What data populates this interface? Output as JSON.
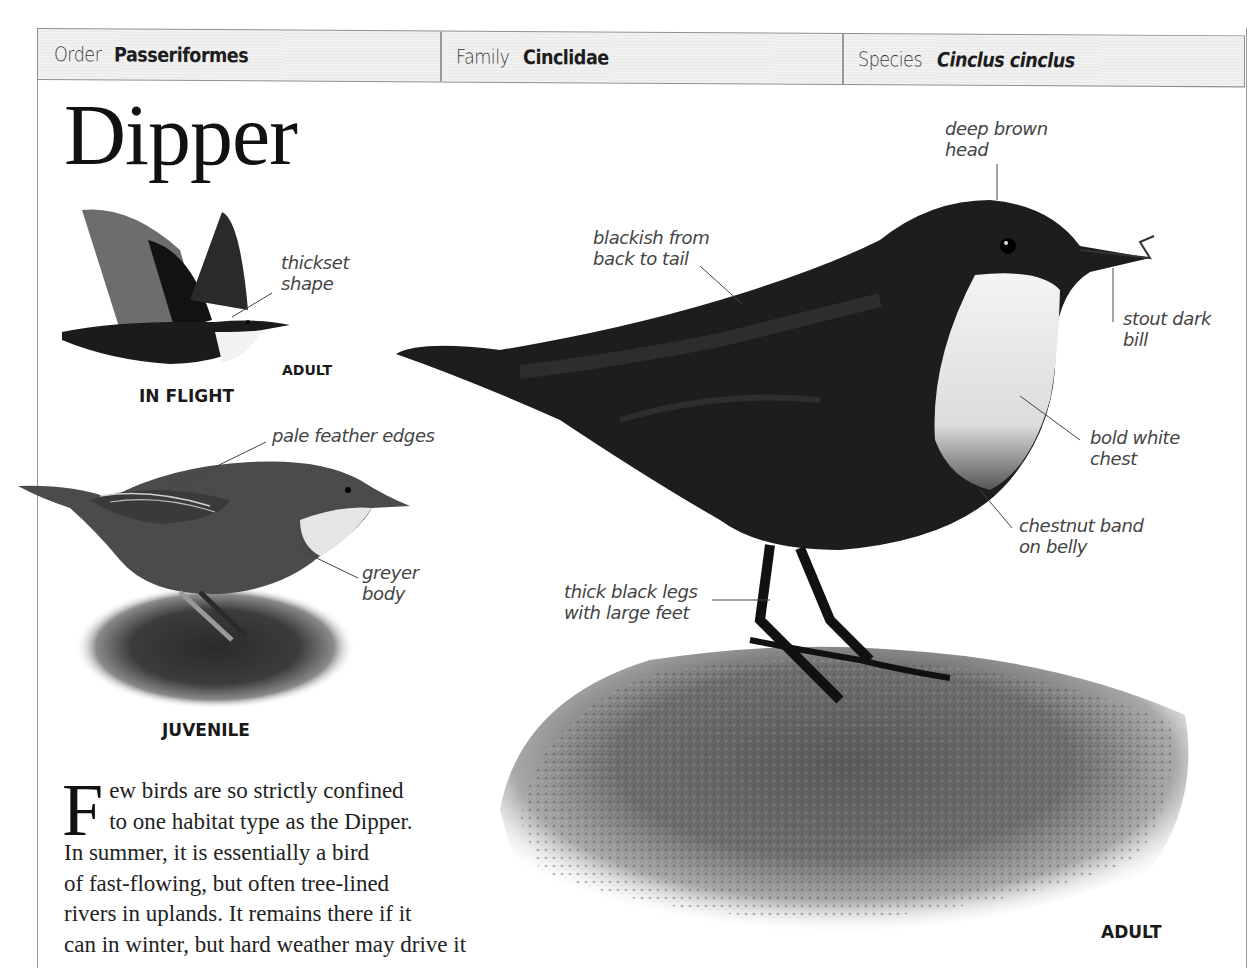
{
  "header": {
    "order": {
      "label": "Order",
      "value": "Passeriformes"
    },
    "family": {
      "label": "Family",
      "value": "Cinclidae"
    },
    "species": {
      "label": "Species",
      "value": "Cinclus cinclus"
    }
  },
  "title": "Dipper",
  "figures": {
    "in_flight": {
      "caption": "IN FLIGHT",
      "sub_caption": "ADULT",
      "annotations": [
        {
          "id": "thickset",
          "lines": [
            "thickset",
            "shape"
          ]
        }
      ]
    },
    "juvenile": {
      "caption": "JUVENILE",
      "annotations": [
        {
          "id": "pale-feather-edges",
          "lines": [
            "pale feather edges"
          ]
        },
        {
          "id": "greyer-body",
          "lines": [
            "greyer",
            "body"
          ]
        }
      ]
    },
    "adult": {
      "caption": "ADULT",
      "annotations": [
        {
          "id": "deep-brown-head",
          "lines": [
            "deep brown",
            "head"
          ]
        },
        {
          "id": "blackish-back",
          "lines": [
            "blackish from",
            "back to tail"
          ]
        },
        {
          "id": "stout-bill",
          "lines": [
            "stout dark",
            "bill"
          ]
        },
        {
          "id": "bold-white-chest",
          "lines": [
            "bold white",
            "chest"
          ]
        },
        {
          "id": "chestnut-band",
          "lines": [
            "chestnut band",
            "on belly"
          ]
        },
        {
          "id": "thick-legs",
          "lines": [
            "thick black legs",
            "with large feet"
          ]
        }
      ]
    }
  },
  "body_text": {
    "drop_cap": "F",
    "lines": [
      "ew birds are so strictly confined",
      "to one habitat type as the Dipper.",
      "In summer, it is essentially a bird",
      "of fast-flowing, but often tree-lined",
      "rivers in uplands. It remains there if it",
      "can in winter, but hard weather may drive it"
    ]
  },
  "colors": {
    "header_bg": "#eeeeee",
    "rule": "#9a9a9a",
    "text": "#222222",
    "label_text": "#444444"
  }
}
